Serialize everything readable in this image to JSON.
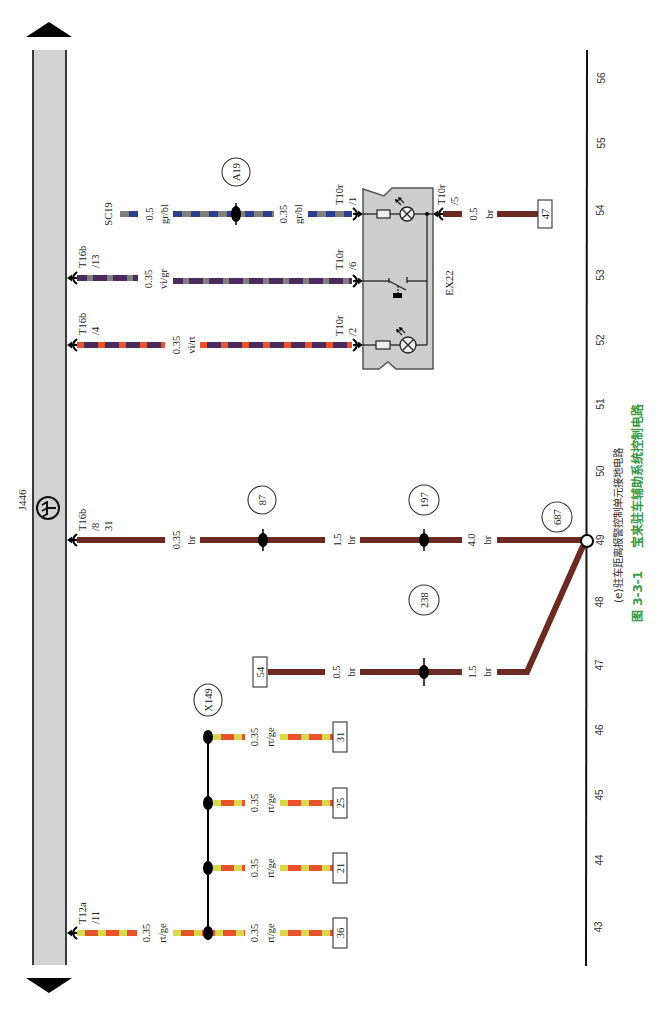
{
  "caption": {
    "subcaption": "(e)驻车距离报警控制单元接地电路",
    "figure_no": "图 3-3-1",
    "figure_title": "宝来驻车辅助系统控制电路"
  },
  "components": {
    "control_unit": "J446",
    "switch_module": "EX22"
  },
  "wire_source": "SC19",
  "connectors": [
    {
      "id": "T16b",
      "pin": "/13"
    },
    {
      "id": "T16b",
      "pin": "/4"
    },
    {
      "id": "T16b",
      "pin": "/8",
      "terminal": "31"
    },
    {
      "id": "T12a",
      "pin": "/11"
    },
    {
      "id": "T10r",
      "pin": "/1"
    },
    {
      "id": "T10r",
      "pin": "/6"
    },
    {
      "id": "T10r",
      "pin": "/2"
    },
    {
      "id": "T10r",
      "pin": "/5"
    }
  ],
  "wires": [
    {
      "sections": [
        {
          "size": "0.5",
          "code": "gr/bl"
        },
        {
          "size": "0.35",
          "code": "gr/bl"
        }
      ]
    },
    {
      "sections": [
        {
          "size": "0.35",
          "code": "vi/gr"
        }
      ]
    },
    {
      "sections": [
        {
          "size": "0.35",
          "code": "vi/rt"
        }
      ]
    },
    {
      "sections": [
        {
          "size": "0.35",
          "code": "br"
        },
        {
          "size": "1.5",
          "code": "br"
        },
        {
          "size": "4.0",
          "code": "br"
        }
      ]
    },
    {
      "sections": [
        {
          "size": "0.5",
          "code": "br"
        },
        {
          "size": "1.5",
          "code": "br"
        }
      ]
    },
    {
      "sections": [
        {
          "size": "0.5",
          "code": "br"
        }
      ]
    },
    {
      "sections": [
        {
          "size": "0.35",
          "code": "rt/ge"
        }
      ]
    },
    {
      "sections": [
        {
          "size": "0.35",
          "code": "rt/ge"
        }
      ]
    },
    {
      "sections": [
        {
          "size": "0.35",
          "code": "rt/ge"
        }
      ]
    },
    {
      "sections": [
        {
          "size": "0.35",
          "code": "rt/ge"
        }
      ]
    },
    {
      "sections": [
        {
          "size": "0.35",
          "code": "rt/ge"
        }
      ]
    }
  ],
  "splice_points": {
    "a19": "A19",
    "s87": "87",
    "s197": "197",
    "s238": "238",
    "s687": "687",
    "x149": "X149"
  },
  "reference_boxes": {
    "b47": "47",
    "b54": "54",
    "b31": "31",
    "b25": "25",
    "b21": "21",
    "b36": "36"
  },
  "grid_axis": {
    "labels": [
      "56",
      "55",
      "54",
      "53",
      "52",
      "51",
      "50",
      "49",
      "48",
      "47",
      "46",
      "45",
      "44",
      "43"
    ]
  },
  "colors": {
    "brown": "#6b2b22",
    "gray": "#7f7f7f",
    "blue": "#2c3f8e",
    "violet": "#4a2b5c",
    "red": "#e8532b",
    "yellow": "#d9d84c",
    "bus_fill": "#d2d2d2",
    "module_fill": "#cdcdcd",
    "caption_green": "#3a9a45"
  }
}
